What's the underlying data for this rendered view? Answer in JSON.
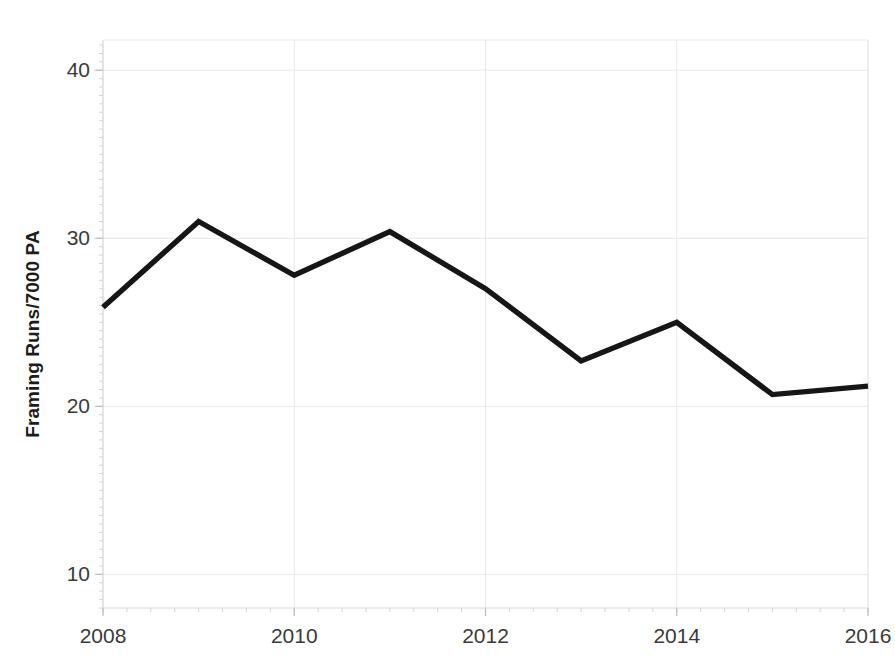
{
  "chart_data": {
    "type": "line",
    "title": "",
    "xlabel": "",
    "ylabel": "Framing Runs/7000 PA",
    "x": [
      2008,
      2009,
      2010,
      2011,
      2012,
      2013,
      2014,
      2015,
      2016
    ],
    "values": [
      25.9,
      31.0,
      27.8,
      30.4,
      27.0,
      22.7,
      25.0,
      20.7,
      21.2
    ],
    "series": [
      {
        "name": "Framing Runs/7000 PA",
        "values": [
          25.9,
          31.0,
          27.8,
          30.4,
          27.0,
          22.7,
          25.0,
          20.7,
          21.2
        ],
        "color": "#161616"
      }
    ],
    "xlim": [
      2008,
      2016
    ],
    "ylim": [
      8.0,
      41.8
    ],
    "xticks": [
      2008,
      2010,
      2012,
      2014,
      2016
    ],
    "xtick_labels": [
      "2008",
      "2010",
      "2012",
      "2014",
      "2016"
    ],
    "yticks": [
      10,
      20,
      30,
      40
    ],
    "ytick_labels": [
      "10",
      "20",
      "30",
      "40"
    ],
    "grid": true,
    "grid_color": "#e9e9ec",
    "legend": false,
    "legend_position": "none",
    "line_color": "#161616",
    "background": "#ffffff"
  }
}
